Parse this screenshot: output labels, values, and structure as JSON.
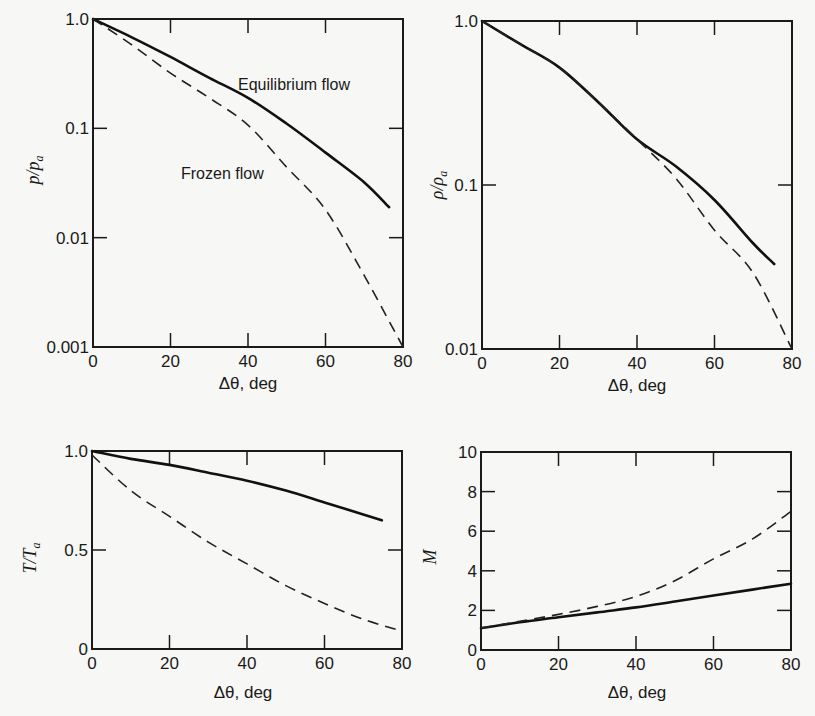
{
  "chart_data": [
    {
      "id": "pressure",
      "type": "line",
      "title": "",
      "xlabel": "Δθ, deg",
      "ylabel": "p/p_a",
      "ylabel_main": "p/p",
      "ylabel_sub": "a",
      "yscale": "log",
      "xlim": [
        0,
        80
      ],
      "ylim": [
        0.001,
        1.0
      ],
      "xticks": [
        0,
        20,
        40,
        60,
        80
      ],
      "xtick_labels": [
        "0",
        "20",
        "40",
        "60",
        "80"
      ],
      "yticks": [
        1.0,
        0.1,
        0.01,
        0.001
      ],
      "ytick_labels": [
        "1.0",
        "0.1",
        "0.01",
        "0.001"
      ],
      "grid": false,
      "annotations": [
        {
          "text": "Equilibrium flow",
          "x": 37,
          "y": 0.25
        },
        {
          "text": "Frozen flow",
          "x": 23,
          "y": 0.038
        }
      ],
      "series": [
        {
          "name": "Equilibrium flow",
          "style": "solid",
          "x": [
            0,
            10,
            20,
            30,
            40,
            50,
            60,
            70,
            76.4
          ],
          "y": [
            1.0,
            0.68,
            0.45,
            0.29,
            0.19,
            0.11,
            0.06,
            0.032,
            0.019
          ]
        },
        {
          "name": "Frozen flow",
          "style": "dashed",
          "x": [
            0,
            10,
            20,
            30,
            40,
            50,
            60,
            70,
            80
          ],
          "y": [
            1.0,
            0.58,
            0.32,
            0.19,
            0.107,
            0.044,
            0.018,
            0.0045,
            0.001
          ]
        }
      ]
    },
    {
      "id": "density",
      "type": "line",
      "title": "",
      "xlabel": "Δθ, deg",
      "ylabel": "ρ/ρ_a",
      "ylabel_main": "ρ/ρ",
      "ylabel_sub": "a",
      "yscale": "log",
      "xlim": [
        0,
        80
      ],
      "ylim": [
        0.01,
        1.0
      ],
      "xticks": [
        0,
        20,
        40,
        60,
        80
      ],
      "xtick_labels": [
        "0",
        "20",
        "40",
        "60",
        "80"
      ],
      "yticks": [
        1.0,
        0.1,
        0.01
      ],
      "ytick_labels": [
        "1.0",
        "0.1",
        "0.01"
      ],
      "grid": false,
      "series": [
        {
          "name": "Equilibrium flow",
          "style": "solid",
          "x": [
            0,
            10,
            20,
            30,
            40,
            50,
            60,
            70,
            75.4
          ],
          "y": [
            1.0,
            0.72,
            0.52,
            0.32,
            0.19,
            0.13,
            0.081,
            0.044,
            0.033
          ]
        },
        {
          "name": "Frozen flow",
          "style": "dashed",
          "x": [
            0,
            10,
            20,
            30,
            40,
            50,
            60,
            70,
            80
          ],
          "y": [
            1.0,
            0.72,
            0.52,
            0.32,
            0.19,
            0.11,
            0.053,
            0.029,
            0.01
          ]
        }
      ]
    },
    {
      "id": "temperature",
      "type": "line",
      "title": "",
      "xlabel": "Δθ, deg",
      "ylabel": "T/T_a",
      "ylabel_main": "T/T",
      "ylabel_sub": "a",
      "yscale": "linear",
      "xlim": [
        0,
        80
      ],
      "ylim": [
        0,
        1.0
      ],
      "xticks": [
        0,
        20,
        40,
        60,
        80
      ],
      "xtick_labels": [
        "0",
        "20",
        "40",
        "60",
        "80"
      ],
      "yticks": [
        0,
        0.5,
        1.0
      ],
      "ytick_labels": [
        "0",
        "0.5",
        "1.0"
      ],
      "grid": false,
      "series": [
        {
          "name": "Equilibrium flow",
          "style": "solid",
          "x": [
            0,
            10,
            20,
            30,
            40,
            50,
            60,
            70,
            74.8
          ],
          "y": [
            1.0,
            0.96,
            0.93,
            0.89,
            0.85,
            0.8,
            0.74,
            0.68,
            0.65
          ]
        },
        {
          "name": "Frozen flow",
          "style": "dashed",
          "x": [
            0,
            10,
            20,
            30,
            40,
            50,
            60,
            70,
            80
          ],
          "y": [
            0.98,
            0.8,
            0.67,
            0.54,
            0.43,
            0.32,
            0.23,
            0.15,
            0.09
          ]
        }
      ]
    },
    {
      "id": "mach",
      "type": "line",
      "title": "",
      "xlabel": "Δθ, deg",
      "ylabel": "M",
      "ylabel_main": "M",
      "ylabel_sub": "",
      "yscale": "linear",
      "xlim": [
        0,
        80
      ],
      "ylim": [
        0,
        10
      ],
      "xticks": [
        0,
        20,
        40,
        60,
        80
      ],
      "xtick_labels": [
        "0",
        "20",
        "40",
        "60",
        "80"
      ],
      "yticks": [
        0,
        2,
        4,
        6,
        8,
        10
      ],
      "ytick_labels": [
        "0",
        "2",
        "4",
        "6",
        "8",
        "10"
      ],
      "grid": false,
      "series": [
        {
          "name": "Equilibrium flow",
          "style": "solid",
          "x": [
            0,
            10,
            20,
            30,
            40,
            50,
            60,
            70,
            80
          ],
          "y": [
            1.1,
            1.4,
            1.65,
            1.9,
            2.15,
            2.45,
            2.75,
            3.05,
            3.35
          ]
        },
        {
          "name": "Frozen flow",
          "style": "dashed",
          "x": [
            0,
            10,
            20,
            30,
            40,
            50,
            60,
            70,
            80
          ],
          "y": [
            1.1,
            1.45,
            1.8,
            2.2,
            2.7,
            3.5,
            4.6,
            5.6,
            7.0
          ]
        }
      ]
    }
  ]
}
